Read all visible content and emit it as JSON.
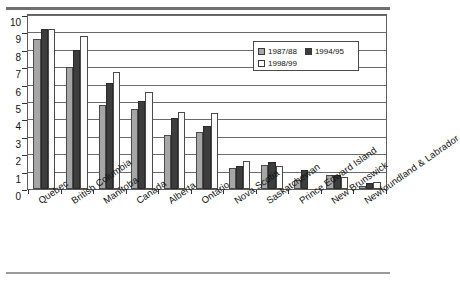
{
  "chart_data": {
    "type": "bar",
    "title": "",
    "subtitle": "",
    "xlabel": "",
    "ylabel": "",
    "ylim": [
      0,
      10
    ],
    "yticks": [
      0,
      1,
      2,
      3,
      4,
      5,
      6,
      7,
      8,
      9,
      10
    ],
    "grid": true,
    "legend_position": "upper-right-inside",
    "categories": [
      "Quebec",
      "British Columbia",
      "Manitoba",
      "Canada",
      "Alberta",
      "Ontario",
      "Nova Scotia",
      "Saskatchewan",
      "Prince Edward Island",
      "New Brunswick",
      "Newfoundland & Labrador"
    ],
    "series": [
      {
        "name": "1987/88",
        "color": "#a6a6a6",
        "values": [
          8.6,
          7.0,
          4.8,
          4.6,
          3.1,
          3.3,
          1.2,
          1.4,
          0.5,
          0.8,
          0.2
        ]
      },
      {
        "name": "1994/95",
        "color": "#3d3d3d",
        "values": [
          9.2,
          8.0,
          6.1,
          5.05,
          4.1,
          3.6,
          1.35,
          1.55,
          1.1,
          0.8,
          0.35
        ]
      },
      {
        "name": "1998/99",
        "color": "#ffffff",
        "values": [
          9.2,
          8.8,
          6.75,
          5.55,
          4.45,
          4.35,
          1.6,
          1.35,
          0.0,
          0.7,
          0.4
        ]
      }
    ]
  },
  "legend": {
    "entries": [
      {
        "label": "1987/88"
      },
      {
        "label": "1994/95"
      },
      {
        "label": "1998/99"
      }
    ]
  }
}
